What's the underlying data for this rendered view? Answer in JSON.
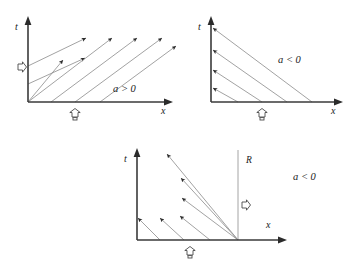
{
  "figure": {
    "top_cropped_caption": "",
    "panels": [
      {
        "id": "panel-a",
        "name": "characteristics-a-positive",
        "axis_t_label": "t",
        "axis_x_label": "x",
        "condition_label": "a > 0",
        "boundary_marker_left": "inflow-arrow-right",
        "boundary_marker_bottom": "inflow-arrow-up",
        "r_label": "",
        "characteristic_direction": "up-right",
        "characteristic_count": 6,
        "slope_sign": "positive"
      },
      {
        "id": "panel-b",
        "name": "characteristics-a-negative",
        "axis_t_label": "t",
        "axis_x_label": "x",
        "condition_label": "a < 0",
        "boundary_marker_left": "outflow-arrow-left",
        "boundary_marker_bottom": "inflow-arrow-up",
        "r_label": "",
        "characteristic_direction": "up-left",
        "characteristic_count": 4,
        "slope_sign": "negative"
      },
      {
        "id": "panel-c",
        "name": "characteristics-a-negative-with-boundary-R",
        "axis_t_label": "t",
        "axis_x_label": "x",
        "condition_label": "a < 0",
        "boundary_marker_left": "",
        "boundary_marker_bottom": "inflow-arrow-up",
        "boundary_marker_right": "inflow-arrow-right",
        "r_label": "R",
        "characteristic_direction": "up-left",
        "characteristic_count": 6,
        "slope_sign": "negative"
      }
    ]
  },
  "colors": {
    "axis": "#3a3a3a",
    "characteristic": "#8a8a8a",
    "arrowhead": "#2b2b2b",
    "boundary_line": "#9a9a9a",
    "text": "#1a1a1a",
    "background": "#ffffff"
  }
}
